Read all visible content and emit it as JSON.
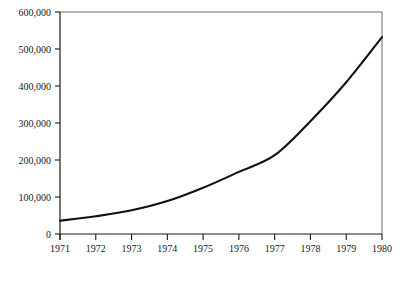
{
  "chart_data": {
    "type": "line",
    "title": "",
    "subtitle": "",
    "xlabel": "",
    "ylabel": "",
    "x": [
      1971,
      1972,
      1973,
      1974,
      1975,
      1976,
      1977,
      1978,
      1979,
      1980
    ],
    "categories": [
      "1971",
      "1972",
      "1973",
      "1974",
      "1975",
      "1976",
      "1977",
      "1978",
      "1979",
      "1980"
    ],
    "values": [
      36000,
      48000,
      64000,
      89000,
      125000,
      168000,
      213000,
      305000,
      410000,
      532000
    ],
    "series": [
      {
        "name": "",
        "values": [
          36000,
          48000,
          64000,
          89000,
          125000,
          168000,
          213000,
          305000,
          410000,
          532000
        ]
      }
    ],
    "xlim": [
      1971,
      1980
    ],
    "ylim": [
      0,
      600000
    ],
    "ytick_values": [
      0,
      100000,
      200000,
      300000,
      400000,
      500000,
      600000
    ],
    "ytick_labels": [
      "0",
      "100,000",
      "200,000",
      "300,000",
      "400,000",
      "500,000",
      "600,000"
    ],
    "xtick_labels": [
      "1971",
      "1972",
      "1973",
      "1974",
      "1975",
      "1976",
      "1977",
      "1978",
      "1979",
      "1980"
    ],
    "grid": false,
    "legend": false,
    "legend_position": "none",
    "line_color": "#111111",
    "axis_color": "#1a1a1a",
    "background_color": "#ffffff"
  }
}
